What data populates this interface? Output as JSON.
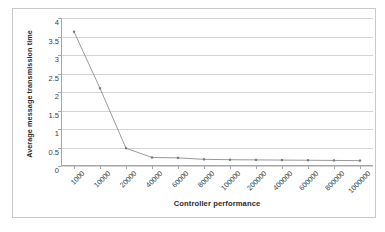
{
  "chart_data": {
    "type": "line",
    "title": "",
    "xlabel": "Controller performance",
    "ylabel": "Average message transmission time",
    "categories": [
      "1000",
      "10000",
      "20000",
      "40000",
      "60000",
      "80000",
      "100000",
      "200000",
      "400000",
      "600000",
      "800000",
      "1000000"
    ],
    "values": [
      3.63,
      2.1,
      0.48,
      0.23,
      0.22,
      0.18,
      0.17,
      0.165,
      0.16,
      0.155,
      0.15,
      0.145
    ],
    "series": [
      {
        "name": "Average message transmission time",
        "values": [
          3.63,
          2.1,
          0.48,
          0.23,
          0.22,
          0.18,
          0.17,
          0.165,
          0.16,
          0.155,
          0.15,
          0.145
        ]
      }
    ],
    "ylim": [
      0,
      4
    ],
    "ytick_labels": [
      "4",
      "3.5",
      "3",
      "2.5",
      "2",
      "1.5",
      "1",
      "0.5",
      "0"
    ],
    "ytick_values": [
      4,
      3.5,
      3,
      2.5,
      2,
      1.5,
      1,
      0.5,
      0
    ],
    "grid": true,
    "grid_axis": "y",
    "legend": "none",
    "line_color": "#8d8d8d",
    "marker_color": "#7a7a7a",
    "marker": "square",
    "border_color": "#c9c9c9",
    "gridline_color": "#d4d4d4",
    "axis_color": "#a6a6a6"
  }
}
